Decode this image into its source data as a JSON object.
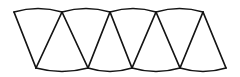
{
  "figure": {
    "background_color": "#ffffff",
    "stroke_color": "#141414",
    "stroke_width": 1.7,
    "canvas": {
      "width": 240,
      "height": 77
    },
    "geometry": {
      "top_vertices": [
        {
          "x": 14,
          "y": 12
        },
        {
          "x": 62,
          "y": 12
        },
        {
          "x": 110,
          "y": 12
        },
        {
          "x": 156,
          "y": 12
        },
        {
          "x": 203,
          "y": 12
        }
      ],
      "bottom_vertices": [
        {
          "x": 36,
          "y": 68
        },
        {
          "x": 88,
          "y": 68
        },
        {
          "x": 132,
          "y": 68
        },
        {
          "x": 180,
          "y": 68
        },
        {
          "x": 226,
          "y": 68
        }
      ],
      "top_arc_bulge": -5,
      "bottom_arc_bulge": 5,
      "triangle_count": 9
    },
    "edges": {
      "top_arcs": [
        "M 14 12 Q 38 5 62 12",
        "M 62 12 Q 86 5 110 12",
        "M 110 12 Q 133 5 156 12",
        "M 156 12 Q 179.5 5 203 12"
      ],
      "bottom_arcs": [
        "M 36 68 Q 62 75 88 68",
        "M 88 68 Q 110 75 132 68",
        "M 132 68 Q 156 75 180 68",
        "M 180 68 Q 203 75 226 68"
      ],
      "diagonals": [
        "M 14 12 L 36 68",
        "M 36 68 L 62 12",
        "M 62 12 L 88 68",
        "M 88 68 L 110 12",
        "M 110 12 L 132 68",
        "M 132 68 L 156 12",
        "M 156 12 L 180 68",
        "M 180 68 L 203 12",
        "M 203 12 L 226 68"
      ]
    }
  }
}
